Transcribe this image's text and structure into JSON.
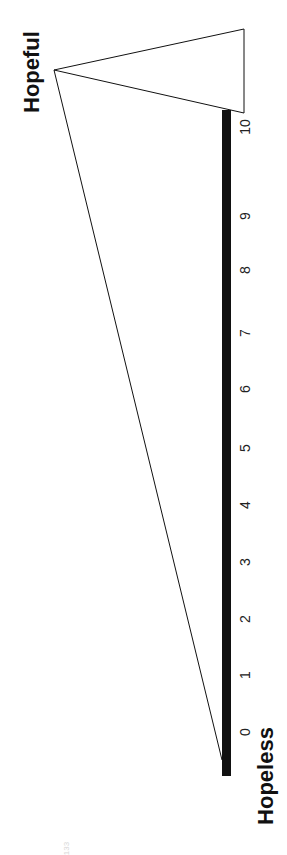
{
  "scale": {
    "low_label": "Hopeless",
    "high_label": "Hopeful",
    "ticks": [
      "0",
      "1",
      "2",
      "3",
      "4",
      "5",
      "6",
      "7",
      "8",
      "9",
      "10"
    ],
    "bar_color": "#111111"
  },
  "footer_text": "133"
}
